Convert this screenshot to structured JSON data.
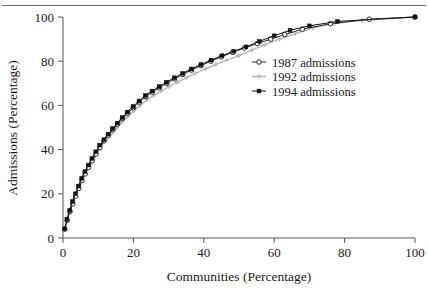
{
  "figure": {
    "background_color": "#ffffff",
    "has_top_rule": true,
    "top_rule_color": "#6f6f6f"
  },
  "chart_data": {
    "type": "line",
    "title": "",
    "subtitle": "",
    "xlabel": "Communities (Percentage)",
    "ylabel": "Admissions (Percentage)",
    "xlim": [
      0,
      100
    ],
    "ylim": [
      0,
      100
    ],
    "xticks": [
      0,
      20,
      40,
      60,
      80,
      100
    ],
    "yticks": [
      0,
      20,
      40,
      60,
      80,
      100
    ],
    "xtick_labels": [
      "0",
      "20",
      "40",
      "60",
      "80",
      "100"
    ],
    "ytick_labels": [
      "0",
      "20",
      "40",
      "60",
      "80",
      "100"
    ],
    "grid": false,
    "legend_position": "center-right",
    "axis_color": "#555555",
    "series": [
      {
        "name": "1987 admissions",
        "color": "#2b2b2b",
        "marker": "open-circle",
        "marker_fill": "#ffffff",
        "x": [
          0.5,
          1.2,
          2.0,
          2.8,
          3.6,
          4.5,
          5.4,
          6.3,
          7.3,
          8.3,
          9.4,
          10.5,
          11.7,
          12.9,
          14.2,
          15.5,
          16.9,
          18.4,
          20.0,
          21.7,
          23.5,
          25.4,
          27.4,
          29.5,
          31.7,
          34.0,
          36.5,
          39.2,
          42.0,
          45.0,
          48.2,
          51.6,
          55.2,
          59.0,
          63.0,
          68.0,
          76.0,
          87.0,
          100.0
        ],
        "y": [
          4.0,
          8.0,
          12.0,
          15.5,
          19.0,
          22.5,
          26.0,
          29.0,
          32.0,
          35.0,
          38.0,
          41.0,
          44.0,
          46.5,
          49.0,
          51.5,
          54.0,
          56.5,
          59.0,
          61.5,
          64.0,
          66.0,
          68.0,
          70.0,
          72.0,
          74.0,
          76.0,
          78.0,
          80.0,
          82.0,
          84.0,
          86.0,
          88.0,
          90.0,
          92.0,
          94.5,
          97.0,
          99.0,
          100.0
        ]
      },
      {
        "name": "1992 admissions",
        "color": "#b9b9b9",
        "marker": "small-plus",
        "marker_fill": "#b9b9b9",
        "x": [
          0.5,
          1.2,
          2.0,
          2.8,
          3.7,
          4.6,
          5.6,
          6.6,
          7.7,
          8.8,
          10.0,
          11.2,
          12.5,
          13.9,
          15.3,
          16.8,
          18.4,
          20.1,
          21.9,
          23.8,
          25.8,
          27.9,
          30.1,
          32.5,
          35.0,
          37.6,
          40.4,
          43.4,
          46.6,
          50.0,
          53.6,
          57.4,
          61.5,
          66.0,
          71.0,
          77.0,
          85.0,
          100.0
        ],
        "y": [
          4.5,
          9.0,
          13.0,
          17.0,
          20.5,
          24.0,
          27.5,
          30.5,
          33.5,
          36.5,
          39.5,
          42.5,
          45.0,
          47.5,
          50.0,
          52.5,
          55.0,
          57.5,
          60.0,
          62.5,
          64.5,
          66.5,
          68.5,
          70.5,
          72.5,
          74.5,
          76.5,
          78.5,
          80.5,
          82.5,
          85.0,
          87.5,
          90.0,
          92.5,
          95.0,
          97.0,
          98.5,
          100.0
        ]
      },
      {
        "name": "1994 admissions",
        "color": "#111111",
        "marker": "filled-square",
        "marker_fill": "#111111",
        "x": [
          0.5,
          1.1,
          1.9,
          2.7,
          3.5,
          4.4,
          5.3,
          6.2,
          7.2,
          8.2,
          9.3,
          10.4,
          11.6,
          12.8,
          14.1,
          15.4,
          16.8,
          18.3,
          19.9,
          21.6,
          23.4,
          25.3,
          27.3,
          29.4,
          31.6,
          34.0,
          36.5,
          39.2,
          42.1,
          45.2,
          48.5,
          52.0,
          55.8,
          60.0,
          64.5,
          70.0,
          78.0,
          100.0
        ],
        "y": [
          4.2,
          8.5,
          12.5,
          16.5,
          20.0,
          23.5,
          27.0,
          30.0,
          33.0,
          36.0,
          39.0,
          42.0,
          44.5,
          47.0,
          49.5,
          52.0,
          54.5,
          57.0,
          59.5,
          62.0,
          64.5,
          66.5,
          68.5,
          70.5,
          72.5,
          74.5,
          76.5,
          78.5,
          80.5,
          82.5,
          84.5,
          86.5,
          89.0,
          91.5,
          94.0,
          96.0,
          98.0,
          100.0
        ]
      }
    ],
    "legend": [
      {
        "label": "1987 admissions",
        "marker": "open-circle",
        "color": "#2b2b2b"
      },
      {
        "label": "1992 admissions",
        "marker": "small-plus",
        "color": "#b9b9b9"
      },
      {
        "label": "1994 admissions",
        "marker": "filled-square",
        "color": "#111111"
      }
    ]
  }
}
